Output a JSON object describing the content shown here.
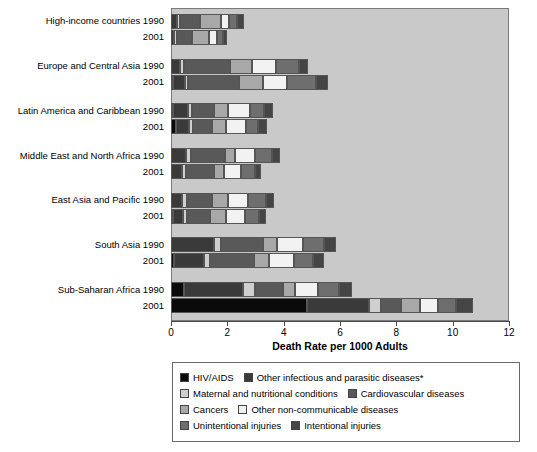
{
  "chart_data": {
    "type": "bar",
    "orientation": "horizontal",
    "stacked": true,
    "title": "",
    "xlabel": "Death Rate per 1000 Adults",
    "ylabel": "",
    "xlim": [
      0,
      12
    ],
    "xticks": [
      0,
      2,
      4,
      6,
      8,
      10,
      12
    ],
    "xtick_labels": [
      "0",
      "2",
      "4",
      "6",
      "8",
      "10",
      "12"
    ],
    "grid": false,
    "legend_position": "below",
    "plot_background": "#c9c9c9",
    "series": [
      {
        "name": "HIV/AIDS",
        "color": "#0a0a0a"
      },
      {
        "name": "Other infectious and parasitic diseases*",
        "color": "#3a3a3a"
      },
      {
        "name": "Maternal and nutritional conditions",
        "color": "#cfcfcf"
      },
      {
        "name": "Cardiovascular diseases",
        "color": "#595959"
      },
      {
        "name": "Cancers",
        "color": "#a8a8a8"
      },
      {
        "name": "Other non-communicable diseases",
        "color": "#f2f2f2"
      },
      {
        "name": "Unintentional injuries",
        "color": "#6e6e6e"
      },
      {
        "name": "Intentional injuries",
        "color": "#454545"
      }
    ],
    "groups": [
      {
        "region": "High-income countries",
        "rows": [
          {
            "year": "1990",
            "values": [
              0.0,
              0.2,
              0.12,
              0.72,
              0.72,
              0.3,
              0.3,
              0.22
            ],
            "total": 2.58
          },
          {
            "year": "2001",
            "values": [
              0.0,
              0.12,
              0.1,
              0.52,
              0.62,
              0.28,
              0.22,
              0.14
            ],
            "total": 2.0
          }
        ]
      },
      {
        "region": "Europe and Central Asia",
        "rows": [
          {
            "year": "1990",
            "values": [
              0.0,
              0.32,
              0.14,
              1.62,
              0.8,
              0.84,
              0.82,
              0.34
            ],
            "total": 4.88
          },
          {
            "year": "2001",
            "values": [
              0.08,
              0.42,
              0.12,
              1.8,
              0.84,
              0.86,
              1.02,
              0.44
            ],
            "total": 5.58
          }
        ]
      },
      {
        "region": "Latin America and Caribbean",
        "rows": [
          {
            "year": "1990",
            "values": [
              0.02,
              0.52,
              0.16,
              0.76,
              0.52,
              0.76,
              0.52,
              0.32
            ],
            "total": 3.58
          },
          {
            "year": "2001",
            "values": [
              0.18,
              0.46,
              0.14,
              0.68,
              0.48,
              0.72,
              0.44,
              0.3
            ],
            "total": 3.4
          }
        ]
      },
      {
        "region": "Middle East and North Africa",
        "rows": [
          {
            "year": "1990",
            "values": [
              0.0,
              0.54,
              0.18,
              1.2,
              0.36,
              0.7,
              0.62,
              0.28
            ],
            "total": 3.88
          },
          {
            "year": "2001",
            "values": [
              0.0,
              0.4,
              0.14,
              1.0,
              0.34,
              0.62,
              0.48,
              0.22
            ],
            "total": 3.2
          }
        ]
      },
      {
        "region": "East Asia and Pacific",
        "rows": [
          {
            "year": "1990",
            "values": [
              0.0,
              0.4,
              0.16,
              0.9,
              0.56,
              0.72,
              0.62,
              0.3
            ],
            "total": 3.66
          },
          {
            "year": "2001",
            "values": [
              0.04,
              0.36,
              0.14,
              0.82,
              0.58,
              0.66,
              0.48,
              0.28
            ],
            "total": 3.36
          }
        ]
      },
      {
        "region": "South Asia",
        "rows": [
          {
            "year": "1990",
            "values": [
              0.0,
              1.54,
              0.22,
              1.5,
              0.5,
              0.92,
              0.76,
              0.42
            ],
            "total": 5.86
          },
          {
            "year": "2001",
            "values": [
              0.12,
              1.06,
              0.22,
              1.54,
              0.54,
              0.9,
              0.68,
              0.36
            ],
            "total": 5.42
          }
        ]
      },
      {
        "region": "Sub-Saharan Africa",
        "rows": [
          {
            "year": "1990",
            "values": [
              0.46,
              2.1,
              0.42,
              1.0,
              0.44,
              0.8,
              0.74,
              0.46
            ],
            "total": 6.42
          },
          {
            "year": "2001",
            "values": [
              4.82,
              2.2,
              0.44,
              0.72,
              0.66,
              0.64,
              0.64,
              0.6
            ],
            "total": 10.72
          }
        ]
      }
    ]
  },
  "axis": {
    "x_title": "Death Rate per 1000 Adults",
    "tick_labels": [
      "0",
      "2",
      "4",
      "6",
      "8",
      "10",
      "12"
    ]
  },
  "legend": {
    "rows": [
      [
        {
          "label": "HIV/AIDS",
          "color": "#0a0a0a"
        },
        {
          "label": "Other infectious and parasitic diseases*",
          "color": "#3a3a3a"
        }
      ],
      [
        {
          "label": "Maternal and nutritional conditions",
          "color": "#cfcfcf"
        },
        {
          "label": "Cardiovascular diseases",
          "color": "#595959"
        }
      ],
      [
        {
          "label": "Cancers",
          "color": "#a8a8a8"
        },
        {
          "label": "Other non-communicable diseases",
          "color": "#f2f2f2"
        }
      ],
      [
        {
          "label": "Unintentional injuries",
          "color": "#6e6e6e"
        },
        {
          "label": "Intentional injuries",
          "color": "#454545"
        }
      ]
    ]
  }
}
